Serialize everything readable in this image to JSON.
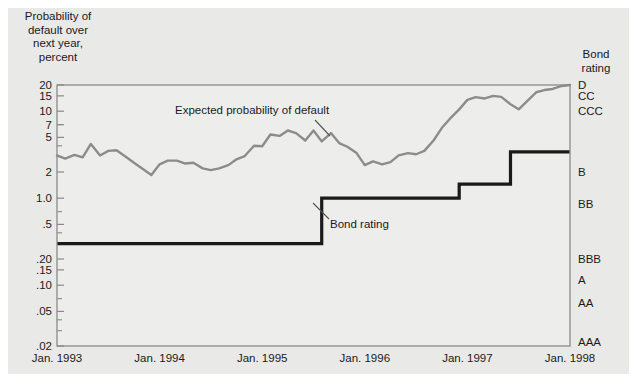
{
  "figure": {
    "background_color": "#e9e9e7",
    "plot_background_color": "#ededeb",
    "axis_color": "#8a8a88",
    "series_color": "#8c8c8a",
    "step_color": "#1a1a1a"
  },
  "axis_titles": {
    "y_left_line1": "Probability of",
    "y_left_line2": "default over",
    "y_left_line3": "next year,",
    "y_left_line4": "percent",
    "y_right_line1": "Bond",
    "y_right_line2": "rating"
  },
  "annotations": [
    {
      "name": "expected-probability-of-default",
      "text": "Expected probability of default"
    },
    {
      "name": "bond-rating",
      "text": "Bond rating"
    }
  ],
  "chart_data": {
    "type": "line",
    "title": "",
    "xlabel": "",
    "ylabel": "Probability of default over next year, percent",
    "y_scale": "log",
    "ylim": [
      0.02,
      20
    ],
    "grid": false,
    "legend_position": "inline-annotation",
    "x_tick_labels": [
      "Jan. 1993",
      "Jan. 1994",
      "Jan. 1995",
      "Jan. 1996",
      "Jan. 1997",
      "Jan. 1998"
    ],
    "x_tick_values": [
      1993.0,
      1994.0,
      1995.0,
      1996.0,
      1997.0,
      1998.0
    ],
    "xlim": [
      1993.0,
      1998.0
    ],
    "y_tick_labels": [
      "20",
      "15",
      "10",
      "7",
      "5",
      "2",
      "1.0",
      ".5",
      ".20",
      ".15",
      ".10",
      ".05",
      ".02"
    ],
    "y_tick_values": [
      20,
      15,
      10,
      7,
      5,
      2,
      1.0,
      0.5,
      0.2,
      0.15,
      0.1,
      0.05,
      0.02
    ],
    "y_right_tick_labels": [
      "D",
      "CC",
      "CCC",
      "B",
      "BB",
      "BBB",
      "A",
      "AA",
      "AAA"
    ],
    "y_right_tick_values": [
      20,
      15,
      10,
      2,
      0.85,
      0.2,
      0.115,
      0.062,
      0.022
    ],
    "series": [
      {
        "name": "Expected probability of default",
        "color": "#8c8c8a",
        "x": [
          1993.0,
          1993.08,
          1993.17,
          1993.25,
          1993.33,
          1993.42,
          1993.5,
          1993.58,
          1993.67,
          1993.75,
          1993.83,
          1993.92,
          1994.0,
          1994.08,
          1994.17,
          1994.25,
          1994.33,
          1994.42,
          1994.5,
          1994.58,
          1994.67,
          1994.75,
          1994.83,
          1994.92,
          1995.0,
          1995.08,
          1995.17,
          1995.25,
          1995.33,
          1995.42,
          1995.5,
          1995.58,
          1995.67,
          1995.75,
          1995.83,
          1995.92,
          1996.0,
          1996.08,
          1996.17,
          1996.25,
          1996.33,
          1996.42,
          1996.5,
          1996.58,
          1996.67,
          1996.75,
          1996.83,
          1996.92,
          1997.0,
          1997.08,
          1997.17,
          1997.25,
          1997.33,
          1997.42,
          1997.5,
          1997.58,
          1997.67,
          1997.75,
          1997.83,
          1997.92,
          1998.0
        ],
        "y": [
          3.1,
          2.85,
          3.15,
          2.95,
          4.2,
          3.1,
          3.5,
          3.55,
          3.0,
          2.55,
          2.2,
          1.85,
          2.45,
          2.7,
          2.7,
          2.5,
          2.55,
          2.2,
          2.1,
          2.2,
          2.4,
          2.8,
          3.05,
          4.0,
          3.95,
          5.4,
          5.2,
          6.0,
          5.6,
          4.6,
          6.0,
          4.5,
          5.6,
          4.3,
          3.9,
          3.3,
          2.4,
          2.65,
          2.45,
          2.6,
          3.1,
          3.3,
          3.2,
          3.5,
          4.6,
          6.4,
          8.2,
          10.5,
          13.5,
          14.5,
          14.0,
          15.0,
          14.6,
          12.0,
          10.5,
          13.0,
          16.5,
          17.5,
          18.0,
          19.5,
          20.0
        ]
      },
      {
        "name": "Bond rating",
        "color": "#1a1a1a",
        "type": "step",
        "x": [
          1993.0,
          1995.58,
          1995.58,
          1996.92,
          1996.92,
          1997.42,
          1997.42,
          1998.0
        ],
        "y": [
          0.3,
          0.3,
          1.0,
          1.0,
          1.45,
          1.45,
          3.4,
          3.4
        ],
        "rating_steps": [
          {
            "from": "Jan. 1993",
            "to": "Aug. 1995",
            "probability": 0.3,
            "rating": "BB"
          },
          {
            "from": "Aug. 1995",
            "to": "Dec. 1996",
            "probability": 1.0,
            "rating": "BB/B"
          },
          {
            "from": "Dec. 1996",
            "to": "Jun. 1997",
            "probability": 1.45,
            "rating": "B"
          },
          {
            "from": "Jun. 1997",
            "to": "Jan. 1998",
            "probability": 3.4,
            "rating": "B"
          }
        ]
      }
    ]
  }
}
